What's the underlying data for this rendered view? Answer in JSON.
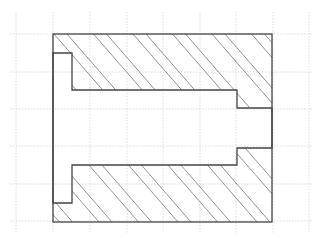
{
  "diagram": {
    "type": "section-view",
    "colors": {
      "background": "#ffffff",
      "grid": "#d4d4d4",
      "outline": "#444444",
      "hatch": "#7a7a7a"
    },
    "grid": {
      "x_lines": [
        16,
        53,
        90,
        127,
        163,
        200,
        236,
        273,
        309
      ],
      "y_lines": [
        34,
        72,
        109,
        146,
        184,
        221
      ],
      "x_range": [
        10,
        312
      ],
      "y_range": [
        12,
        234
      ]
    },
    "shapes": {
      "outer_body": {
        "x": 53,
        "y": 34,
        "w": 219,
        "h": 188
      },
      "flange_slot": {
        "x": 53,
        "y": 53,
        "w": 19,
        "h": 150
      },
      "main_bore": {
        "x": 72,
        "y": 90,
        "w": 165,
        "h": 75
      },
      "end_hole": {
        "x": 237,
        "y": 108,
        "w": 35,
        "h": 40
      }
    },
    "hatch": {
      "angle_slope": 1.15,
      "period": 39.5,
      "pair_offsets": [
        54,
        67
      ],
      "reference_y": 34
    }
  }
}
